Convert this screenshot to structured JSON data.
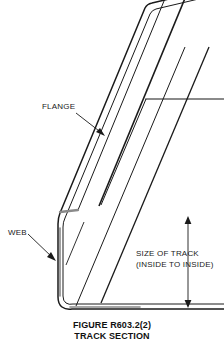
{
  "figure": {
    "caption_line1": "FIGURE R603.2(2)",
    "caption_line2": "TRACK SECTION",
    "labels": {
      "flange": "FLANGE",
      "web": "WEB",
      "dimension_line1": "SIZE OF TRACK",
      "dimension_line2": "(INSIDE TO INSIDE)"
    },
    "colors": {
      "background": "#ffffff",
      "line": "#1a1a1a",
      "shading": "#8a8a8a",
      "text": "#111111"
    }
  }
}
